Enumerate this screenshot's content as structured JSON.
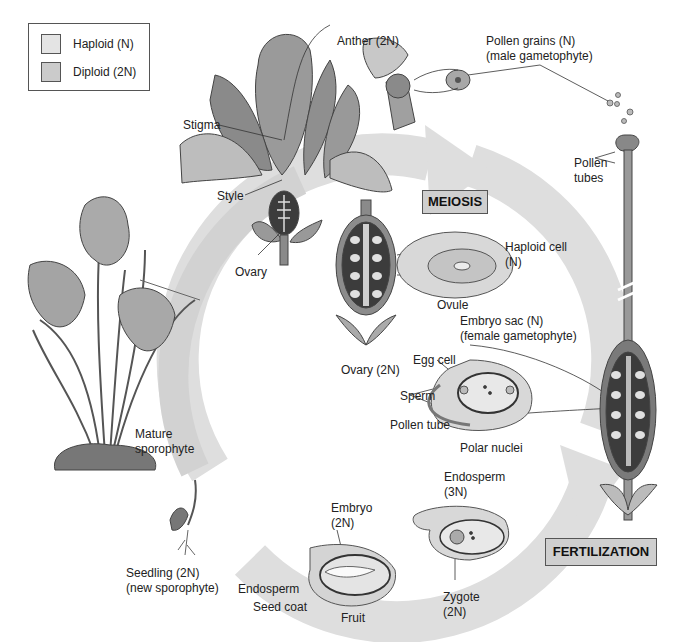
{
  "legend": {
    "items": [
      {
        "label": "Haploid (N)",
        "color": "#e4e4e4"
      },
      {
        "label": "Diploid (2N)",
        "color": "#cbcbcb"
      }
    ]
  },
  "stages": {
    "meiosis": "MEIOSIS",
    "fertilization": "FERTILIZATION"
  },
  "labels": {
    "anther": "Anther (2N)",
    "pollen_grains_1": "Pollen grains (N)",
    "pollen_grains_2": "(male gametophyte)",
    "stigma": "Stigma",
    "style": "Style",
    "ovary": "Ovary",
    "pollen_tubes_1": "Pollen",
    "pollen_tubes_2": "tubes",
    "haploid_cell_1": "Haploid cell",
    "haploid_cell_2": "(N)",
    "ovule": "Ovule",
    "embryo_sac_1": "Embryo sac (N)",
    "embryo_sac_2": "(female gametophyte)",
    "ovary_2n": "Ovary (2N)",
    "egg_cell": "Egg cell",
    "sperm": "Sperm",
    "pollen_tube": "Pollen tube",
    "polar_nuclei": "Polar nuclei",
    "mature_sporophyte_1": "Mature",
    "mature_sporophyte_2": "sporophyte",
    "endosperm_3n_1": "Endosperm",
    "endosperm_3n_2": "(3N)",
    "embryo_1": "Embryo",
    "embryo_2": "(2N)",
    "zygote_1": "Zygote",
    "zygote_2": "(2N)",
    "seedling_1": "Seedling (2N)",
    "seedling_2": "(new sporophyte)",
    "endosperm": "Endosperm",
    "seed_coat": "Seed coat",
    "fruit": "Fruit"
  },
  "colors": {
    "cycle_arrow": "#dcdcdc",
    "tissue_dark": "#4a4a4a",
    "tissue_mid": "#8c8c8c",
    "tissue_light": "#d6d6d6"
  }
}
